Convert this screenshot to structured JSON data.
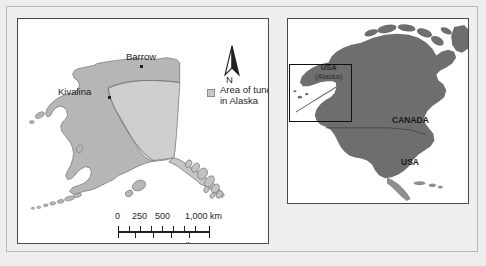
{
  "alaska_map": {
    "cities": [
      {
        "name": "Barrow",
        "label": "Barrow"
      },
      {
        "name": "Kivalina",
        "label": "Kivalina"
      }
    ],
    "north_arrow_label": "N",
    "legend": {
      "label_line1": "Area of tundra",
      "label_line2": "in Alaska",
      "swatch_color": "#c9c9c9"
    },
    "scale": {
      "km_labels": [
        "0",
        "250",
        "500",
        "1,000 km"
      ],
      "miles_label": "500  miles"
    },
    "colors": {
      "land": "#b6b6b6",
      "tundra": "#cfcfcf",
      "outline": "#6e6e6e",
      "panel_border": "#4a4a4a"
    }
  },
  "north_america_map": {
    "labels": [
      {
        "name": "canada",
        "text": "CANADA"
      },
      {
        "name": "usa",
        "text": "USA"
      }
    ],
    "alaska_label": {
      "line1": "USA",
      "line2": "(Alaska)"
    },
    "colors": {
      "land": "#6e6e6e",
      "highlight_box": "#111111",
      "panel_border": "#4a4a4a"
    }
  }
}
